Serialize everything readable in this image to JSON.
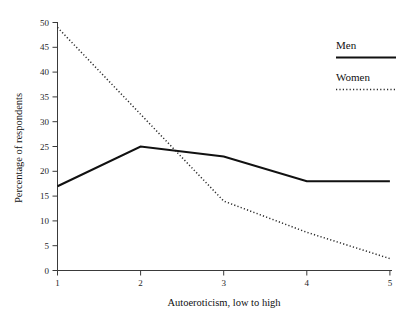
{
  "chart_data": {
    "type": "line",
    "title": "",
    "subtitle": "",
    "xlabel": "Autoeroticism, low to high",
    "ylabel": "Percentage of respondents",
    "x": [
      1,
      2,
      3,
      4,
      5
    ],
    "xticklabels": [
      "1",
      "2",
      "3",
      "4",
      "5"
    ],
    "yticks": [
      0,
      5,
      10,
      15,
      20,
      25,
      30,
      35,
      40,
      45,
      50
    ],
    "yticklabels": [
      "0",
      "5",
      "10",
      "15",
      "20",
      "25",
      "30",
      "35",
      "40",
      "45",
      "50"
    ],
    "xlim": [
      1,
      5
    ],
    "ylim": [
      0,
      50
    ],
    "grid": false,
    "legend_position": "top-right",
    "series": [
      {
        "name": "Men",
        "style": "solid",
        "color": "#111111",
        "values": [
          17,
          25,
          23,
          18,
          18
        ]
      },
      {
        "name": "Women",
        "style": "dotted",
        "color": "#2b2b2b",
        "values": [
          49,
          31.5,
          14,
          7.7,
          2.4
        ]
      }
    ]
  },
  "legend": {
    "entries": [
      {
        "label": "Men",
        "style": "solid"
      },
      {
        "label": "Women",
        "style": "dotted"
      }
    ]
  },
  "axes": {
    "x_title": "Autoeroticism, low to high",
    "y_title": "Percentage of respondents"
  },
  "colors": {
    "men_line": "#111111",
    "women_line": "#2b2b2b",
    "axis": "#3a3a3a",
    "background": "#ffffff",
    "text": "#111111"
  }
}
